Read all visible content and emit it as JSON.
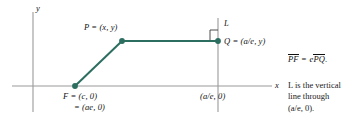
{
  "figure": {
    "kind": "geometry-diagram",
    "colors": {
      "axis": "#9a9a9a",
      "curve": "#2c6e60",
      "point": "#2c6e60",
      "text": "#111111",
      "background": "#ffffff"
    },
    "axes": {
      "y_label": "y",
      "x_label": "x",
      "origin_px": [
        33,
        86
      ]
    },
    "directrix": {
      "line_label": "L",
      "x_px": 218
    },
    "points": [
      {
        "id": "P",
        "label": "P = (x, y)",
        "px": [
          122,
          41
        ]
      },
      {
        "id": "Q",
        "label": "Q = (a/e, y)",
        "px": [
          218,
          41
        ]
      },
      {
        "id": "F",
        "label": "F = (c, 0)",
        "label_line2": "= (ae, 0)",
        "px": [
          75,
          86
        ]
      }
    ],
    "tick_labels": [
      {
        "text": "(a/e, 0)",
        "px": [
          200,
          91
        ]
      }
    ],
    "annotations": {
      "equation": {
        "lhs": "PF",
        "equals": "=",
        "rhs_coef": "e",
        "rhs_seg": "PQ",
        "period": "."
      },
      "note_lines": [
        "L is the vertical",
        "line through",
        "(a/e, 0)."
      ]
    }
  }
}
